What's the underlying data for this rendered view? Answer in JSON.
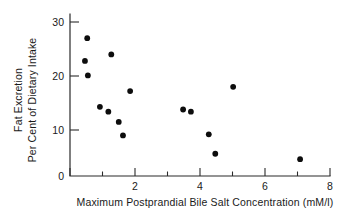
{
  "chart_data": {
    "type": "scatter",
    "title": "",
    "xlabel": "Maximum Postprandial Bile Salt Concentration (mM/l)",
    "ylabel_line1": "Fat Excretion",
    "ylabel_line2": "Per Cent of Dietary Intake",
    "xlim": [
      0,
      8
    ],
    "ylim": [
      0,
      32
    ],
    "xticks": [
      0,
      2,
      4,
      6,
      8
    ],
    "xtick_labels": [
      "0",
      "2",
      "4",
      "6",
      "8"
    ],
    "xticks_minor": [
      1,
      3,
      5,
      7
    ],
    "yticks": [
      10,
      20,
      30
    ],
    "ytick_labels": [
      "10",
      "20",
      "30"
    ],
    "grid": false,
    "legend": "none",
    "marker": "filled-circle",
    "marker_color": "#0d0d0d",
    "axis_color": "#2b2b2b",
    "background": "#ffffff",
    "points": [
      {
        "x": 0.53,
        "y": 27.0
      },
      {
        "x": 0.46,
        "y": 22.8
      },
      {
        "x": 0.55,
        "y": 20.1
      },
      {
        "x": 1.27,
        "y": 24.0
      },
      {
        "x": 1.85,
        "y": 17.2
      },
      {
        "x": 0.92,
        "y": 14.3
      },
      {
        "x": 1.18,
        "y": 13.4
      },
      {
        "x": 1.5,
        "y": 11.5
      },
      {
        "x": 1.63,
        "y": 9.0
      },
      {
        "x": 3.48,
        "y": 13.8
      },
      {
        "x": 3.72,
        "y": 13.4
      },
      {
        "x": 4.27,
        "y": 9.2
      },
      {
        "x": 4.47,
        "y": 5.6
      },
      {
        "x": 5.02,
        "y": 18.0
      },
      {
        "x": 7.08,
        "y": 4.6
      }
    ]
  }
}
